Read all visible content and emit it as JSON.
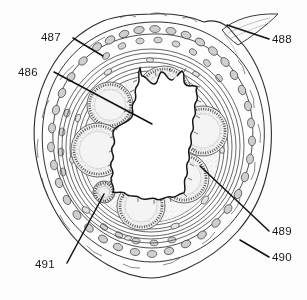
{
  "figure": {
    "background_color": "#fdfdfd",
    "ink_color": "#1a1a1a"
  },
  "callouts": [
    {
      "id": "486",
      "label": "486",
      "text_x": 18,
      "text_y": 76,
      "leader": "M 54 72 L 152 124",
      "target": "central-lumen-epithelial-fold",
      "anchor": "start"
    },
    {
      "id": "487",
      "label": "487",
      "text_x": 41,
      "text_y": 41,
      "leader": "M 73 38 L 103 56",
      "target": "outer-cellular-layer",
      "anchor": "start"
    },
    {
      "id": "488",
      "label": "488",
      "text_x": 272,
      "text_y": 43,
      "leader": "M 269 39 L 227 25",
      "target": "projecting-tissue-flap",
      "anchor": "start"
    },
    {
      "id": "489",
      "label": "489",
      "text_x": 272,
      "text_y": 235,
      "leader": "M 269 231 L 200 166",
      "target": "gland-acinus-lower-right",
      "anchor": "start"
    },
    {
      "id": "490",
      "label": "490",
      "text_x": 272,
      "text_y": 261,
      "leader": "M 269 257 L 240 240",
      "target": "outer-wall-boundary",
      "anchor": "start"
    },
    {
      "id": "491",
      "label": "491",
      "text_x": 35,
      "text_y": 268,
      "leader": "M 67 263 L 104 194",
      "target": "small-gland-lower-left",
      "anchor": "start"
    }
  ],
  "glands": [
    {
      "name": "gland-upper-left",
      "cx": 110,
      "cy": 105,
      "r": 23
    },
    {
      "name": "gland-upper-right",
      "cx": 164,
      "cy": 93,
      "r": 27
    },
    {
      "name": "gland-right",
      "cx": 203,
      "cy": 131,
      "r": 25
    },
    {
      "name": "gland-left",
      "cx": 98,
      "cy": 150,
      "r": 27
    },
    {
      "name": "gland-lower-right",
      "cx": 184,
      "cy": 178,
      "r": 25
    },
    {
      "name": "gland-lower-center",
      "cx": 141,
      "cy": 206,
      "r": 24
    },
    {
      "name": "gland-small-left",
      "cx": 104,
      "cy": 192,
      "r": 11
    }
  ],
  "layers": [
    {
      "name": "outer-adventitia-cell-layer",
      "label": "487"
    },
    {
      "name": "muscular-layers",
      "label": "490"
    },
    {
      "name": "lumen-epithelium",
      "label": "486"
    },
    {
      "name": "tissue-flap",
      "label": "488"
    }
  ]
}
